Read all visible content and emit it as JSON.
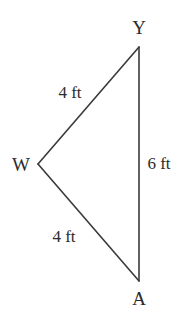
{
  "figure": {
    "name": "triangle-wya",
    "background_color": "#ffffff",
    "stroke_color": "#3a3a3a",
    "text_color": "#2b2b2b",
    "stroke_width": 1.6
  },
  "vertices": [
    {
      "id": "Y",
      "label": "Y",
      "x": 139,
      "y": 47,
      "label_x": 139,
      "label_y": 27
    },
    {
      "id": "W",
      "label": "W",
      "x": 38,
      "y": 164,
      "label_x": 21,
      "label_y": 164
    },
    {
      "id": "A",
      "label": "A",
      "x": 139,
      "y": 281,
      "label_x": 139,
      "label_y": 298
    }
  ],
  "sides": [
    {
      "id": "WY",
      "from": "W",
      "to": "Y",
      "label": "4 ft",
      "label_x": 70,
      "label_y": 92
    },
    {
      "id": "WA",
      "from": "W",
      "to": "A",
      "label": "4 ft",
      "label_x": 64,
      "label_y": 236
    },
    {
      "id": "YA",
      "from": "Y",
      "to": "A",
      "label": "6 ft",
      "label_x": 159,
      "label_y": 163
    }
  ],
  "chart_data": {
    "type": "diagram",
    "shape": "triangle",
    "title": "",
    "vertex_labels": [
      "Y",
      "W",
      "A"
    ],
    "vertex_points": [
      [
        139,
        47
      ],
      [
        38,
        164
      ],
      [
        139,
        281
      ]
    ],
    "side_labels": [
      "4 ft",
      "4 ft",
      "6 ft"
    ],
    "side_lengths": [
      4,
      4,
      6
    ],
    "units": "ft",
    "classification": "isosceles",
    "grid": false,
    "legend": false
  }
}
